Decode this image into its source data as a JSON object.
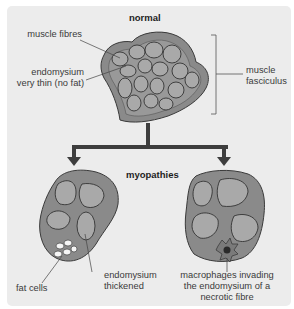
{
  "diagram": {
    "title_normal": "normal",
    "title_myopathies": "myopathies",
    "labels": {
      "muscle_fibres": "muscle fibres",
      "endomysium_thin_1": "endomysium",
      "endomysium_thin_2": "very thin (no fat)",
      "fasciculus_1": "muscle",
      "fasciculus_2": "fasciculus",
      "fat_cells": "fat cells",
      "endo_thick_1": "endomysium",
      "endo_thick_2": "thickened",
      "macro_1": "macrophages invading",
      "macro_2": "the endomysium of a",
      "macro_3": "necrotic fibre"
    },
    "colors": {
      "background": "#ececec",
      "perimysium": "#8a8a8a",
      "fibre": "#a9a9a9",
      "outline": "#3a3a3a",
      "arrow": "#3d3d3d",
      "macrophage": "#7a7a7a"
    }
  }
}
